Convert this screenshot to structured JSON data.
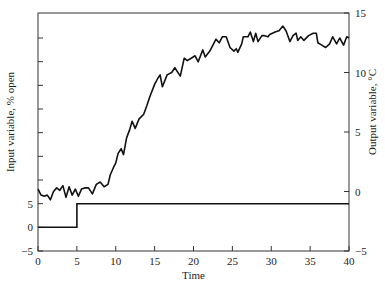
{
  "chart_data": {
    "type": "line",
    "title": "",
    "xlabel": "Time",
    "xlim": [
      0,
      40
    ],
    "xticks": [
      0,
      5,
      10,
      15,
      20,
      25,
      30,
      35,
      40
    ],
    "grid": false,
    "legend": null,
    "left_axis": {
      "label": "Input variable, % open",
      "range": [
        -5,
        40
      ],
      "labeled_ticks": [
        -5,
        0,
        5
      ],
      "unlabeled_ticks": [
        10,
        15,
        20,
        25,
        30,
        35,
        40
      ]
    },
    "right_axis": {
      "label": "Output variable, °C",
      "range": [
        -5,
        15
      ],
      "ticks": [
        -5,
        0,
        5,
        10,
        15
      ]
    },
    "series": [
      {
        "name": "Input variable (% open)",
        "axis": "left",
        "style": "step",
        "x": [
          0,
          5,
          5,
          40
        ],
        "y": [
          0,
          0,
          5,
          5
        ]
      },
      {
        "name": "Output variable (°C)",
        "axis": "right",
        "style": "line",
        "x": [
          0,
          0.4,
          0.8,
          1.2,
          1.6,
          2.0,
          2.4,
          2.8,
          3.2,
          3.6,
          4.0,
          4.4,
          4.8,
          5.2,
          5.6,
          6.0,
          6.5,
          7.0,
          7.5,
          8.0,
          8.5,
          9.0,
          9.3,
          9.7,
          10.0,
          10.3,
          10.7,
          11.0,
          11.4,
          11.8,
          12.1,
          12.5,
          13.0,
          13.6,
          14.0,
          14.4,
          15.0,
          15.4,
          15.7,
          16.0,
          16.6,
          17.2,
          17.6,
          18.3,
          18.8,
          19.2,
          19.7,
          20.2,
          20.6,
          21.2,
          21.5,
          22.1,
          22.5,
          22.9,
          23.3,
          23.7,
          24.2,
          24.7,
          25.2,
          25.5,
          25.7,
          26.2,
          26.4,
          27.0,
          27.3,
          27.7,
          28.0,
          28.3,
          28.8,
          29.0,
          29.6,
          29.8,
          30.5,
          31.0,
          31.5,
          31.9,
          32.4,
          32.8,
          33.2,
          33.4,
          33.8,
          34.2,
          34.8,
          35.4,
          35.8,
          36.0,
          36.5,
          37.0,
          37.5,
          37.9,
          38.4,
          38.8,
          39.3,
          39.7,
          40.0
        ],
        "y": [
          0.2,
          -0.3,
          -0.4,
          -0.3,
          -0.7,
          0.0,
          0.3,
          0.1,
          0.5,
          -0.5,
          0.4,
          -0.3,
          0.2,
          -0.4,
          0.2,
          0.3,
          0.3,
          -0.2,
          0.6,
          0.8,
          0.4,
          0.6,
          1.4,
          2.0,
          2.4,
          3.2,
          3.6,
          3.1,
          4.5,
          5.2,
          5.9,
          5.3,
          6.1,
          6.5,
          7.2,
          8.0,
          9.0,
          9.5,
          9.8,
          8.8,
          9.8,
          10.0,
          10.4,
          9.7,
          11.2,
          11.0,
          11.2,
          11.4,
          10.9,
          11.9,
          11.3,
          11.8,
          12.3,
          12.8,
          12.5,
          13.0,
          13.0,
          12.1,
          11.8,
          12.0,
          11.7,
          12.4,
          13.0,
          13.0,
          13.4,
          12.6,
          13.3,
          12.6,
          13.1,
          13.1,
          13.0,
          13.2,
          13.4,
          13.5,
          13.9,
          13.5,
          12.6,
          13.1,
          13.3,
          12.7,
          13.0,
          12.7,
          13.1,
          13.3,
          13.3,
          12.5,
          12.3,
          12.1,
          12.4,
          13.0,
          12.4,
          12.9,
          12.3,
          13.0,
          12.9
        ]
      }
    ]
  }
}
